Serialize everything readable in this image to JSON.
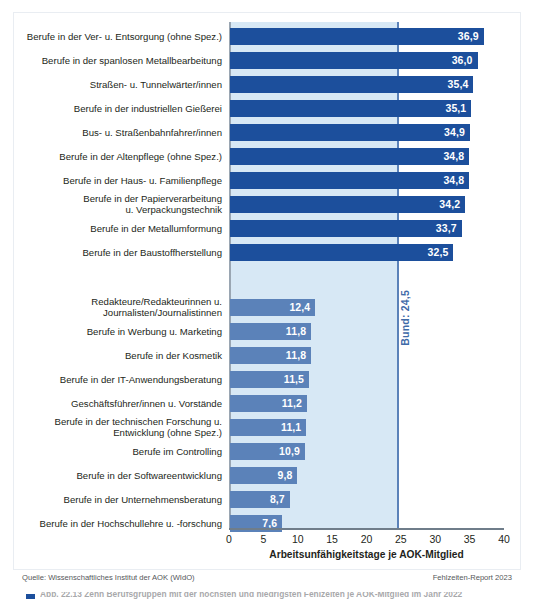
{
  "chart_data": {
    "type": "bar",
    "orientation": "horizontal",
    "title": "",
    "xlabel": "Arbeitsunfähigkeitstage je AOK-Mitglied",
    "ylabel": "",
    "xlim": [
      0,
      40
    ],
    "xticks": [
      0,
      5,
      10,
      15,
      20,
      25,
      30,
      35,
      40
    ],
    "xtick_labels": [
      "0",
      "5",
      "10",
      "15",
      "20",
      "25",
      "30",
      "35",
      "40"
    ],
    "grid": false,
    "legend": "",
    "reference_line": {
      "label": "Bund: 24,5",
      "value": 24.5,
      "color": "#5b82b9"
    },
    "groups": [
      {
        "name": "highest",
        "color": "#1c4f9c",
        "categories": [
          "Berufe in der Ver- u. Entsorgung (ohne Spez.)",
          "Berufe in der spanlosen Metallbearbeitung",
          "Straßen- u. Tunnelwärter/innen",
          "Berufe in der industriellen Gießerei",
          "Bus- u. Straßenbahnfahrer/innen",
          "Berufe in der Altenpflege (ohne Spez.)",
          "Berufe in der Haus- u. Familienpflege",
          "Berufe in der Papierverarbeitung\nu. Verpackungstechnik",
          "Berufe in der Metallumformung",
          "Berufe in der Baustoffherstellung"
        ],
        "values": [
          36.9,
          36.0,
          35.4,
          35.1,
          34.9,
          34.8,
          34.8,
          34.2,
          33.7,
          32.5
        ],
        "value_labels": [
          "36,9",
          "36,0",
          "35,4",
          "35,1",
          "34,9",
          "34,8",
          "34,8",
          "34,2",
          "33,7",
          "32,5"
        ]
      },
      {
        "name": "lowest",
        "color": "#5b82b9",
        "categories": [
          "Redakteure/Redakteurinnen u.\nJournalisten/Journalistinnen",
          "Berufe in Werbung u. Marketing",
          "Berufe in der Kosmetik",
          "Berufe in der IT-Anwendungsberatung",
          "Geschäftsführer/innen u. Vorstände",
          "Berufe in der technischen Forschung u.\nEntwicklung (ohne Spez.)",
          "Berufe im Controlling",
          "Berufe in der Softwareentwicklung",
          "Berufe in der Unternehmensberatung",
          "Berufe in der Hochschullehre u. -forschung"
        ],
        "values": [
          12.4,
          11.8,
          11.8,
          11.5,
          11.2,
          11.1,
          10.9,
          9.8,
          8.7,
          7.6
        ],
        "value_labels": [
          "12,4",
          "11,8",
          "11,8",
          "11,5",
          "11,2",
          "11,1",
          "10,9",
          "9,8",
          "8,7",
          "7,6"
        ]
      }
    ]
  },
  "footer": {
    "source": "Quelle: Wissenschaftliches Institut der AOK (WIdO)",
    "report": "Fehlzeiten-Report 2023"
  },
  "caption": {
    "text": "Abb. 22.13  Zehn Berufsgruppen mit der höchsten und niedrigsten Fehlzeiten je AOK-Mitglied im Jahr 2022"
  },
  "colors": {
    "bar_dark": "#1c4f9c",
    "bar_light": "#5b82b9",
    "band": "#d7e8f5",
    "axis": "#6f7d8a",
    "text": "#231f20"
  }
}
